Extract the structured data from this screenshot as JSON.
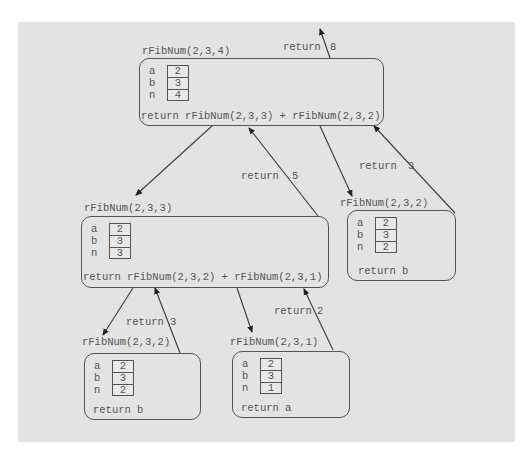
{
  "diagram": {
    "frames": [
      {
        "id": "call-4",
        "title": "rFibNum(2,3,4)",
        "vars": [
          {
            "name": "a",
            "value": "2"
          },
          {
            "name": "b",
            "value": "3"
          },
          {
            "name": "n",
            "value": "4"
          }
        ],
        "statement": "return rFibNum(2,3,3) + rFibNum(2,3,2)"
      },
      {
        "id": "call-3",
        "title": "rFibNum(2,3,3)",
        "vars": [
          {
            "name": "a",
            "value": "2"
          },
          {
            "name": "b",
            "value": "3"
          },
          {
            "name": "n",
            "value": "3"
          }
        ],
        "statement": "return rFibNum(2,3,2) + rFibNum(2,3,1)"
      },
      {
        "id": "call-2-right",
        "title": "rFibNum(2,3,2)",
        "vars": [
          {
            "name": "a",
            "value": "2"
          },
          {
            "name": "b",
            "value": "3"
          },
          {
            "name": "n",
            "value": "2"
          }
        ],
        "statement": "return b"
      },
      {
        "id": "call-2-left",
        "title": "rFibNum(2,3,2)",
        "vars": [
          {
            "name": "a",
            "value": "2"
          },
          {
            "name": "b",
            "value": "3"
          },
          {
            "name": "n",
            "value": "2"
          }
        ],
        "statement": "return b"
      },
      {
        "id": "call-1",
        "title": "rFibNum(2,3,1)",
        "vars": [
          {
            "name": "a",
            "value": "2"
          },
          {
            "name": "b",
            "value": "3"
          },
          {
            "name": "n",
            "value": "1"
          }
        ],
        "statement": "return a"
      }
    ],
    "returns": [
      {
        "from": "call-4",
        "text": "return",
        "value": "8"
      },
      {
        "from": "call-3",
        "text": "return",
        "value": "5"
      },
      {
        "from": "call-2-right",
        "text": "return",
        "value": "3"
      },
      {
        "from": "call-2-left",
        "text": "return",
        "value": "3"
      },
      {
        "from": "call-1",
        "text": "return",
        "value": "2"
      }
    ],
    "colors": {
      "background": "#e3e3e3",
      "line": "#555555",
      "text": "#555555"
    }
  }
}
